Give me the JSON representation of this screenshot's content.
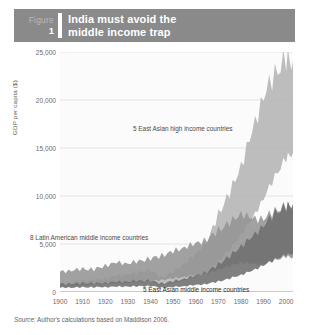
{
  "figure": {
    "label_word": "Figure",
    "number": "1",
    "title_line1": "India must avoid the",
    "title_line2": "middle income trap",
    "banner_color": "#8a8a8a"
  },
  "source": {
    "prefix": "Source:",
    "text": "Author's calculations based on Maddison 2006."
  },
  "annotations": {
    "high_income": "5 East Asian high income countries",
    "latin_america": "8 Latin American middle income countries",
    "east_asia_middle": "5 East Asian middle income countries"
  },
  "colors": {
    "band_high_income": "#b4b4b4",
    "band_latin_america": "#949494",
    "band_east_asia_middle": "#6e6e6e",
    "gridline": "#e3e3e3",
    "axis": "#9a9a9a",
    "plot_background": "#fbfbfb"
  },
  "chart_data": {
    "type": "area",
    "title": "India must avoid the middle income trap",
    "xlabel": "",
    "ylabel": "GDP per capita ($)",
    "xlim": [
      1900,
      2003
    ],
    "ylim": [
      0,
      25000
    ],
    "grid": true,
    "legend_position": "inline-annotations",
    "yticks": [
      0,
      5000,
      10000,
      15000,
      20000,
      25000
    ],
    "ytick_labels": [
      "0",
      "5,000",
      "10,000",
      "15,000",
      "20,000",
      "25,000"
    ],
    "xticks": [
      1900,
      1910,
      1920,
      1930,
      1940,
      1950,
      1960,
      1970,
      1980,
      1990,
      2000
    ],
    "xtick_labels": [
      "1900",
      "1910",
      "1920",
      "1930",
      "1940",
      "1950",
      "1960",
      "1970",
      "1980",
      "1990",
      "2000"
    ],
    "x": [
      1900,
      1905,
      1910,
      1915,
      1920,
      1925,
      1930,
      1935,
      1940,
      1945,
      1950,
      1955,
      1960,
      1965,
      1970,
      1975,
      1980,
      1985,
      1990,
      1995,
      2000,
      2003
    ],
    "series": [
      {
        "name": "5 East Asian high income countries",
        "kind": "range-band",
        "color": "#b4b4b4",
        "upper": [
          900,
          1000,
          1150,
          1250,
          1400,
          1700,
          1850,
          2050,
          2300,
          1500,
          2100,
          3000,
          3900,
          5200,
          8100,
          10300,
          13200,
          16600,
          20600,
          22600,
          24400,
          24000
        ],
        "lower": [
          600,
          650,
          700,
          760,
          800,
          900,
          950,
          1000,
          1050,
          700,
          900,
          1200,
          1600,
          2100,
          3200,
          4400,
          6000,
          7600,
          9800,
          12000,
          14000,
          14500
        ]
      },
      {
        "name": "8 Latin American middle income countries",
        "kind": "range-band",
        "color": "#949494",
        "upper": [
          2100,
          2250,
          2400,
          2350,
          2750,
          3050,
          3000,
          3200,
          3500,
          3800,
          4200,
          4700,
          5000,
          5500,
          6400,
          7200,
          8200,
          7600,
          7700,
          8400,
          9000,
          8900
        ],
        "lower": [
          700,
          750,
          800,
          820,
          900,
          1000,
          1000,
          1050,
          1150,
          1250,
          1400,
          1600,
          1750,
          1950,
          2300,
          2700,
          3100,
          2900,
          2950,
          3300,
          3700,
          3600
        ]
      },
      {
        "name": "5 East Asian middle income countries",
        "kind": "range-band",
        "color": "#6e6e6e",
        "upper": [
          800,
          850,
          900,
          900,
          950,
          1050,
          1100,
          1150,
          1200,
          900,
          1100,
          1400,
          1700,
          2100,
          2900,
          3700,
          4800,
          5700,
          7000,
          8200,
          8900,
          9200
        ],
        "lower": [
          450,
          470,
          490,
          500,
          520,
          560,
          580,
          600,
          620,
          450,
          520,
          620,
          720,
          850,
          1100,
          1400,
          1800,
          2200,
          2800,
          3400,
          3900,
          4000
        ]
      }
    ]
  }
}
